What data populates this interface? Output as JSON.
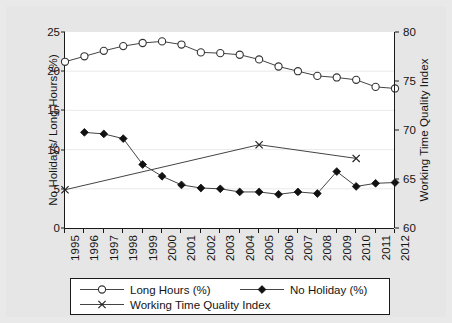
{
  "chart_data": {
    "type": "line",
    "title": "",
    "xlabel": "",
    "ylabel": "No Holidays/ Long Hours (%)",
    "y2label": "Working Time Quality Index",
    "grid": true,
    "legend_position": "bottom",
    "x": [
      1995,
      1996,
      1997,
      1998,
      1999,
      2000,
      2001,
      2002,
      2003,
      2004,
      2005,
      2006,
      2007,
      2008,
      2009,
      2010,
      2011,
      2012
    ],
    "categories": [
      "1995",
      "1996",
      "1997",
      "1998",
      "1999",
      "2000",
      "2001",
      "2002",
      "2003",
      "2004",
      "2005",
      "2006",
      "2007",
      "2008",
      "2009",
      "2010",
      "2011",
      "2012"
    ],
    "ylim": [
      0,
      25
    ],
    "y2lim": [
      60,
      80
    ],
    "yticks": [
      0,
      5,
      10,
      15,
      20,
      25
    ],
    "y2ticks": [
      60,
      65,
      70,
      75,
      80
    ],
    "series": [
      {
        "name": "Long Hours (%)",
        "axis": "left",
        "marker": "open-circle",
        "x": [
          1995,
          1996,
          1997,
          1998,
          1999,
          2000,
          2001,
          2002,
          2003,
          2004,
          2005,
          2006,
          2007,
          2008,
          2009,
          2010,
          2011,
          2012
        ],
        "values": [
          21.2,
          21.9,
          22.6,
          23.2,
          23.6,
          23.8,
          23.4,
          22.4,
          22.3,
          22.1,
          21.5,
          20.6,
          20.0,
          19.4,
          19.2,
          18.9,
          18.0,
          17.8
        ]
      },
      {
        "name": "No Holiday (%)",
        "axis": "left",
        "marker": "filled-diamond",
        "x": [
          1996,
          1997,
          1998,
          1999,
          2000,
          2001,
          2002,
          2003,
          2004,
          2005,
          2006,
          2007,
          2008,
          2009,
          2010,
          2011,
          2012
        ],
        "values": [
          12.2,
          12.0,
          11.4,
          8.1,
          6.6,
          5.5,
          5.1,
          5.0,
          4.6,
          4.6,
          4.3,
          4.6,
          4.4,
          7.2,
          5.3,
          5.7,
          5.8
        ]
      },
      {
        "name": "Working Time Quality Index",
        "axis": "right",
        "marker": "cross",
        "x": [
          1995,
          2005,
          2010
        ],
        "values": [
          63.9,
          68.5,
          67.1
        ]
      }
    ]
  },
  "legend": {
    "items": [
      {
        "label": "Long Hours (%)",
        "marker": "open-circle"
      },
      {
        "label": "No Holiday (%)",
        "marker": "filled-diamond"
      },
      {
        "label": "Working Time Quality Index",
        "marker": "cross"
      }
    ]
  },
  "colors": {
    "line": "#333333",
    "axis": "#1a1a1a",
    "grid": "#e4e4e4",
    "plot_background": "#ffffff",
    "figure_background": "#e9e9e9"
  }
}
